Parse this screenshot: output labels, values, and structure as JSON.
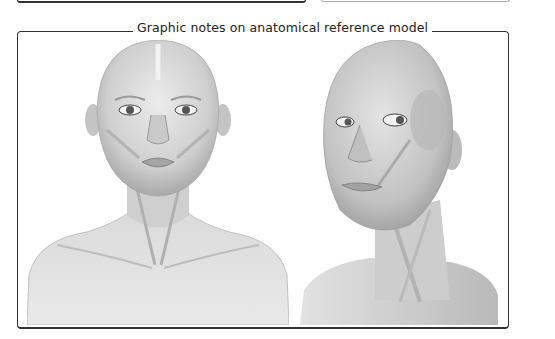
{
  "panel": {
    "title": "Graphic notes on anatomical reference model"
  },
  "figures": [
    {
      "id": "front-view",
      "description": "Frontal view of female head, neck and shoulders with facial muscles overlay"
    },
    {
      "id": "three-quarter-view",
      "description": "Three-quarter view of female head and neck with facial and neck muscles overlay"
    }
  ],
  "colors": {
    "frame_border": "#333333",
    "skin_light": "#e6e6e6",
    "skin_mid": "#c8c8c8",
    "skin_dark": "#8a8a8a",
    "background": "#ffffff"
  }
}
